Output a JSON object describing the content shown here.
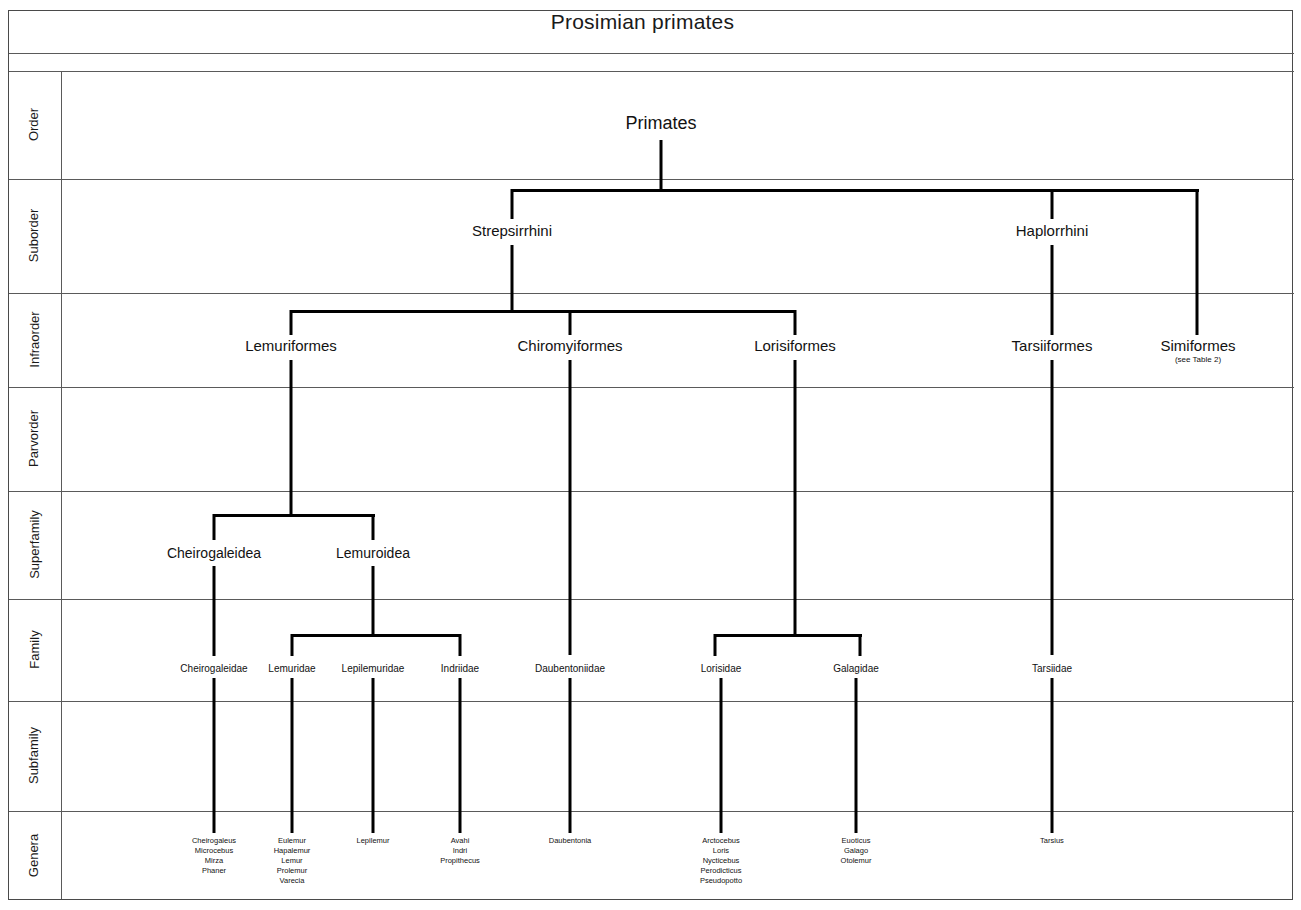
{
  "title": "Prosimian primates",
  "rank_rows": [
    {
      "label": "Order"
    },
    {
      "label": "Suborder"
    },
    {
      "label": "Infraorder"
    },
    {
      "label": "Parvorder"
    },
    {
      "label": "Superfamily"
    },
    {
      "label": "Family"
    },
    {
      "label": "Subfamily"
    },
    {
      "label": "Genera"
    }
  ],
  "chart_data": {
    "type": "diagram",
    "title": "Prosimian primates",
    "subtype": "taxonomic hierarchy tree",
    "ranks": [
      "Order",
      "Suborder",
      "Infraorder",
      "Parvorder",
      "Superfamily",
      "Family",
      "Subfamily",
      "Genera"
    ],
    "nodes": {
      "order": [
        {
          "label": "Primates"
        }
      ],
      "suborder": [
        {
          "label": "Strepsirrhini",
          "parent": "Primates"
        },
        {
          "label": "Haplorrhini",
          "parent": "Primates"
        }
      ],
      "infraorder": [
        {
          "label": "Lemuriformes",
          "parent": "Strepsirrhini"
        },
        {
          "label": "Chiromyiformes",
          "parent": "Strepsirrhini"
        },
        {
          "label": "Lorisiformes",
          "parent": "Strepsirrhini"
        },
        {
          "label": "Tarsiiformes",
          "parent": "Haplorrhini"
        },
        {
          "label": "Simiformes",
          "note": "(see Table 2)",
          "parent": "Haplorrhini"
        }
      ],
      "superfamily": [
        {
          "label": "Cheirogaleidea",
          "parent": "Lemuriformes"
        },
        {
          "label": "Lemuroidea",
          "parent": "Lemuriformes"
        }
      ],
      "family": [
        {
          "label": "Cheirogaleidae",
          "parent": "Cheirogaleidea"
        },
        {
          "label": "Lemuridae",
          "parent": "Lemuroidea"
        },
        {
          "label": "Lepilemuridae",
          "parent": "Lemuroidea"
        },
        {
          "label": "Indriidae",
          "parent": "Lemuroidea"
        },
        {
          "label": "Daubentoniidae",
          "parent": "Chiromyiformes"
        },
        {
          "label": "Lorisidae",
          "parent": "Lorisiformes"
        },
        {
          "label": "Galagidae",
          "parent": "Lorisiformes"
        },
        {
          "label": "Tarsiidae",
          "parent": "Tarsiiformes"
        }
      ],
      "genera": [
        {
          "parent": "Cheirogaleidae",
          "label": "Cheirogaleus\nMicrocebus\nMirza\nPhaner"
        },
        {
          "parent": "Lemuridae",
          "label": "Eulemur\nHapalemur\nLemur\nProlemur\nVarecia"
        },
        {
          "parent": "Lepilemuridae",
          "label": "Lepilemur"
        },
        {
          "parent": "Indriidae",
          "label": "Avahi\nIndri\nPropithecus"
        },
        {
          "parent": "Daubentoniidae",
          "label": "Daubentonia"
        },
        {
          "parent": "Lorisidae",
          "label": "Arctocebus\nLoris\nNycticebus\nPerodicticus\nPseudopotto"
        },
        {
          "parent": "Galagidae",
          "label": "Euoticus\nGalago\nOtolemur"
        },
        {
          "parent": "Tarsiidae",
          "label": "Tarsius"
        }
      ]
    }
  },
  "tree": {
    "order": {
      "primates": "Primates"
    },
    "suborder": {
      "strepsirrhini": "Strepsirrhini",
      "haplorrhini": "Haplorrhini"
    },
    "infraorder": {
      "lemuriformes": "Lemuriformes",
      "chiromyiformes": "Chiromyiformes",
      "lorisiformes": "Lorisiformes",
      "tarsiiformes": "Tarsiiformes",
      "simiformes": "Simiformes",
      "simiformes_note": "(see Table 2)"
    },
    "superfamily": {
      "cheirogaleidea": "Cheirogaleidea",
      "lemuroidea": "Lemuroidea"
    },
    "family": {
      "cheirogaleidae": "Cheirogaleidae",
      "lemuridae": "Lemuridae",
      "lepilemuridae": "Lepilemuridae",
      "indriidae": "Indriidae",
      "daubentoniidae": "Daubentoniidae",
      "lorisidae": "Lorisidae",
      "galagidae": "Galagidae",
      "tarsiidae": "Tarsiidae"
    },
    "genera": {
      "cheirogaleidae": "Cheirogaleus\nMicrocebus\nMirza\nPhaner",
      "lemuridae": "Eulemur\nHapalemur\nLemur\nProlemur\nVarecia",
      "lepilemuridae": "Lepilemur",
      "indriidae": "Avahi\nIndri\nPropithecus",
      "daubentoniidae": "Daubentonia",
      "lorisidae": "Arctocebus\nLoris\nNycticebus\nPerodicticus\nPseudopotto",
      "galagidae": "Euoticus\nGalago\nOtolemur",
      "tarsiidae": "Tarsius"
    }
  }
}
